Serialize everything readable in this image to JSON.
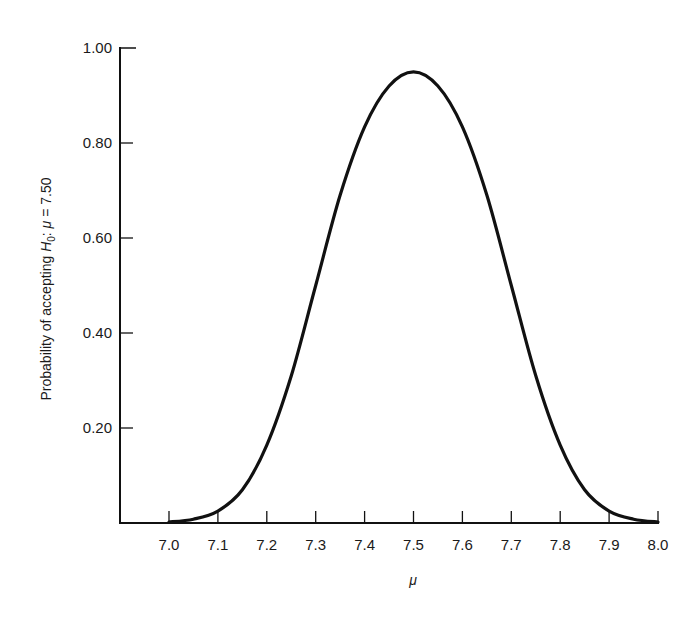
{
  "chart_data": {
    "type": "line",
    "title": "",
    "xlabel": "μ",
    "ylabel": "Probability of accepting H0: μ = 7.50",
    "ylabel_parts": {
      "prefix": "Probability of accepting ",
      "h": "H",
      "sub": "0",
      "colon": ": ",
      "mu": "μ",
      "suffix": " = 7.50"
    },
    "xlim": [
      7.0,
      8.0
    ],
    "ylim": [
      0,
      1.0
    ],
    "grid": false,
    "legend": null,
    "x_ticks": [
      "7.0",
      "7.1",
      "7.2",
      "7.3",
      "7.4",
      "7.5",
      "7.6",
      "7.7",
      "7.8",
      "7.9",
      "8.0"
    ],
    "y_ticks": [
      "0.20",
      "0.40",
      "0.60",
      "0.80",
      "1.00"
    ],
    "series": [
      {
        "name": "Operating characteristic curve",
        "color": "#111111",
        "x": [
          7.0,
          7.05,
          7.1,
          7.15,
          7.2,
          7.25,
          7.3,
          7.35,
          7.4,
          7.45,
          7.5,
          7.55,
          7.6,
          7.65,
          7.7,
          7.75,
          7.8,
          7.85,
          7.9,
          7.95,
          8.0
        ],
        "y": [
          0.002,
          0.008,
          0.025,
          0.07,
          0.164,
          0.31,
          0.5,
          0.69,
          0.834,
          0.92,
          0.95,
          0.92,
          0.834,
          0.69,
          0.5,
          0.31,
          0.164,
          0.07,
          0.025,
          0.008,
          0.002
        ]
      }
    ]
  }
}
